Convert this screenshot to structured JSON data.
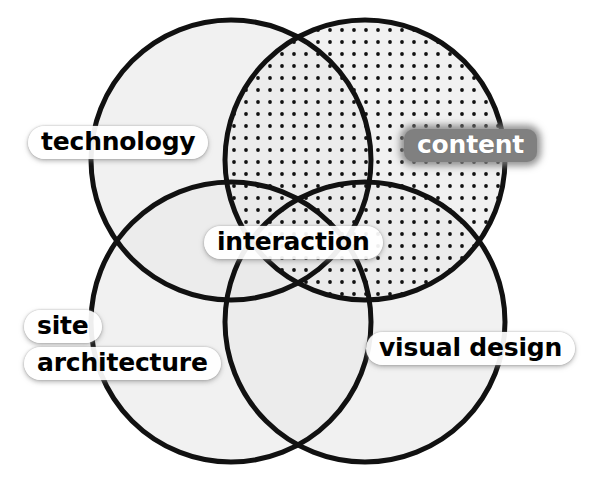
{
  "diagram": {
    "type": "venn",
    "title": "",
    "background_color": "#ffffff",
    "stroke_color": "#111111",
    "stroke_width": 5,
    "fill_color": "#e9e9e9",
    "fill_opacity": 0.62,
    "dot_color": "#111111",
    "dot_spacing": 12,
    "dot_radius": 1.9,
    "canvas": {
      "width": 594,
      "height": 483
    },
    "circles": [
      {
        "key": "technology",
        "label": "technology",
        "cx": 231,
        "cy": 160,
        "r": 140,
        "pattern": "solid",
        "label_style": "light"
      },
      {
        "key": "content",
        "label": "content",
        "cx": 365,
        "cy": 160,
        "r": 140,
        "pattern": "dotted",
        "label_style": "dark"
      },
      {
        "key": "site-architecture",
        "label": "site architecture",
        "label_lines": [
          "site",
          "architecture"
        ],
        "cx": 231,
        "cy": 322,
        "r": 140,
        "pattern": "solid",
        "label_style": "light"
      },
      {
        "key": "visual-design",
        "label": "visual design",
        "cx": 365,
        "cy": 322,
        "r": 140,
        "pattern": "solid",
        "label_style": "light"
      }
    ],
    "center_label": {
      "key": "interaction",
      "label": "interaction",
      "label_style": "light"
    },
    "label_colors": {
      "light_background": "#ffffff",
      "light_text": "#000000",
      "dark_background": "#808080",
      "dark_text": "#ffffff"
    }
  }
}
